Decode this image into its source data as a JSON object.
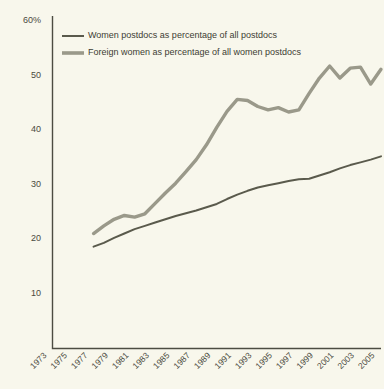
{
  "chart_data": {
    "type": "line",
    "title": "",
    "xlabel": "",
    "ylabel": "",
    "ylim": [
      0,
      60
    ],
    "xlim": [
      1973,
      2005
    ],
    "grid": false,
    "legend_position": "top-left",
    "y_ticks": [
      {
        "value": 60,
        "label": "60%"
      },
      {
        "value": 50,
        "label": "50"
      },
      {
        "value": 40,
        "label": "40"
      },
      {
        "value": 30,
        "label": "30"
      },
      {
        "value": 20,
        "label": "20"
      },
      {
        "value": 10,
        "label": "10"
      }
    ],
    "x_ticks": [
      "1973",
      "1975",
      "1977",
      "1979",
      "1981",
      "1983",
      "1985",
      "1987",
      "1989",
      "1991",
      "1993",
      "1995",
      "1997",
      "1999",
      "2001",
      "2003",
      "2005"
    ],
    "x": [
      1977,
      1978,
      1979,
      1980,
      1981,
      1982,
      1983,
      1984,
      1985,
      1986,
      1987,
      1988,
      1989,
      1990,
      1991,
      1992,
      1993,
      1994,
      1995,
      1996,
      1997,
      1998,
      1999,
      2000,
      2001,
      2002,
      2003,
      2004,
      2005
    ],
    "series": [
      {
        "name": "Women postdocs as percentage of all postdocs",
        "color": "#5a5a4c",
        "values": [
          18.6,
          19.3,
          20.2,
          21.0,
          21.8,
          22.4,
          23.0,
          23.6,
          24.2,
          24.7,
          25.2,
          25.8,
          26.4,
          27.3,
          28.1,
          28.8,
          29.4,
          29.8,
          30.2,
          30.6,
          30.9,
          31.0,
          31.6,
          32.2,
          32.9,
          33.5,
          34.0,
          34.5,
          35.1
        ]
      },
      {
        "name": "Foreign women as percentage of all women postdocs",
        "color": "#9a998a",
        "values": [
          21.0,
          22.4,
          23.6,
          24.3,
          24.0,
          24.6,
          26.5,
          28.4,
          30.2,
          32.3,
          34.5,
          37.2,
          40.4,
          43.3,
          45.5,
          45.3,
          44.2,
          43.6,
          44.0,
          43.2,
          43.6,
          46.6,
          49.4,
          51.6,
          49.4,
          51.2,
          51.4,
          48.3,
          51.0
        ]
      }
    ],
    "legend": [
      {
        "label": "Women postdocs as percentage of all postdocs",
        "color": "#5a5a4c",
        "style": "thin"
      },
      {
        "label": "Foreign women as percentage of all women postdocs",
        "color": "#9a998a",
        "style": "thick"
      }
    ],
    "colors": {
      "background": "#f8f7ec",
      "axis": "#4c4c42",
      "text": "#4a4a40",
      "series_dark": "#5a5a4c",
      "series_gray": "#9a998a"
    }
  }
}
